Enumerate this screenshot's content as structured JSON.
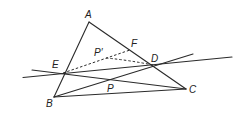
{
  "diagram": {
    "type": "geometry-figure",
    "points": {
      "A": {
        "label": "A",
        "x": 89,
        "y": 22
      },
      "B": {
        "label": "B",
        "x": 54,
        "y": 97
      },
      "C": {
        "label": "C",
        "x": 186,
        "y": 89
      },
      "D": {
        "label": "D",
        "x": 153,
        "y": 65
      },
      "E": {
        "label": "E",
        "x": 63,
        "y": 74
      },
      "F": {
        "label": "F",
        "x": 130,
        "y": 50
      },
      "P_prime": {
        "label": "P′",
        "x": 106,
        "y": 58
      },
      "P": {
        "label": "P",
        "x": 108,
        "y": 80
      }
    },
    "solid_segments": [
      {
        "name": "AB",
        "from": "A",
        "to": "B"
      },
      {
        "name": "AC",
        "from": "A",
        "to": "C"
      },
      {
        "name": "BC",
        "from": "B",
        "to": "C"
      },
      {
        "name": "line-ED-extended",
        "from": "E",
        "to": "D",
        "extended": true
      },
      {
        "name": "line-BD-extended",
        "from": "B",
        "to": "D",
        "extended": true
      },
      {
        "name": "line-EC-extended",
        "from": "E",
        "to": "C",
        "extended": true
      }
    ],
    "dashed_segments": [
      {
        "name": "EF",
        "from": "E",
        "to": "F"
      },
      {
        "name": "P'D",
        "from": "P_prime",
        "to": "D"
      }
    ]
  }
}
